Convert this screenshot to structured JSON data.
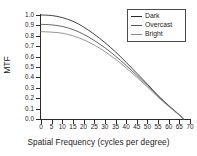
{
  "chart_data": {
    "type": "line",
    "title": "",
    "xlabel": "Spatial Frequency (cycles per degree)",
    "ylabel": "MTF",
    "xlim": [
      0,
      70
    ],
    "ylim": [
      0.0,
      1.0
    ],
    "xticks": [
      0,
      5,
      10,
      15,
      20,
      25,
      30,
      35,
      40,
      45,
      50,
      55,
      60,
      65,
      70
    ],
    "xticklabels": [
      "0",
      "5",
      "10",
      "15",
      "20",
      "25",
      "30",
      "35",
      "40",
      "45",
      "50",
      "55",
      "60",
      "65",
      "70"
    ],
    "yticks": [
      0.0,
      0.1,
      0.2,
      0.3,
      0.4,
      0.5,
      0.6,
      0.7,
      0.8,
      0.9,
      1.0
    ],
    "yticklabels": [
      "0.0",
      "0.1",
      "0.2",
      "0.3",
      "0.4",
      "0.5",
      "0.6",
      "0.7",
      "0.8",
      "0.9",
      "1.0"
    ],
    "grid": false,
    "legend_position": "upper right",
    "x": [
      0,
      5,
      10,
      15,
      20,
      25,
      30,
      35,
      40,
      45,
      50,
      55,
      60,
      65,
      67
    ],
    "series": [
      {
        "name": "Dark",
        "color": "#2b2b2b",
        "values": [
          1.0,
          0.995,
          0.975,
          0.94,
          0.885,
          0.815,
          0.735,
          0.645,
          0.545,
          0.44,
          0.335,
          0.225,
          0.13,
          0.04,
          0.0
        ]
      },
      {
        "name": "Overcast",
        "color": "#555555",
        "values": [
          0.91,
          0.905,
          0.89,
          0.86,
          0.815,
          0.755,
          0.685,
          0.605,
          0.515,
          0.42,
          0.32,
          0.218,
          0.125,
          0.038,
          0.0
        ]
      },
      {
        "name": "Bright",
        "color": "#8a8a8a",
        "values": [
          0.84,
          0.835,
          0.825,
          0.8,
          0.762,
          0.712,
          0.648,
          0.575,
          0.492,
          0.402,
          0.308,
          0.21,
          0.121,
          0.037,
          0.0
        ]
      }
    ]
  },
  "legend": {
    "items": [
      {
        "label": "Dark"
      },
      {
        "label": "Overcast"
      },
      {
        "label": "Bright"
      }
    ]
  }
}
